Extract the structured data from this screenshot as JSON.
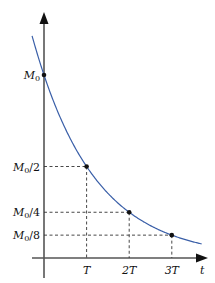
{
  "chart_data": {
    "type": "line",
    "title": "",
    "xlabel": "t",
    "ylabel": "",
    "x_ticks": [
      {
        "label": "T",
        "value": 1
      },
      {
        "label": "2T",
        "value": 2
      },
      {
        "label": "3T",
        "value": 3
      }
    ],
    "y_ticks": [
      {
        "label_main": "M",
        "label_sub": "0",
        "label_suffix": "",
        "value": 1.0
      },
      {
        "label_main": "M",
        "label_sub": "0",
        "label_suffix": "/2",
        "value": 0.5
      },
      {
        "label_main": "M",
        "label_sub": "0",
        "label_suffix": "/4",
        "value": 0.25
      },
      {
        "label_main": "M",
        "label_sub": "0",
        "label_suffix": "/8",
        "value": 0.125
      }
    ],
    "series": [
      {
        "name": "exponential decay M(t) = M0 * 2^(-t/T)",
        "x": [
          -0.28,
          0,
          0.5,
          1,
          1.5,
          2,
          2.5,
          3,
          3.7
        ],
        "values": [
          1.21,
          1.0,
          0.707,
          0.5,
          0.354,
          0.25,
          0.177,
          0.125,
          0.077
        ],
        "color": "#3a5fa8"
      }
    ],
    "marked_points": [
      {
        "x": 0,
        "y": 1.0
      },
      {
        "x": 1,
        "y": 0.5
      },
      {
        "x": 2,
        "y": 0.25
      },
      {
        "x": 3,
        "y": 0.125
      }
    ],
    "grid": false,
    "guide_lines": "dashed",
    "legend": "none"
  }
}
